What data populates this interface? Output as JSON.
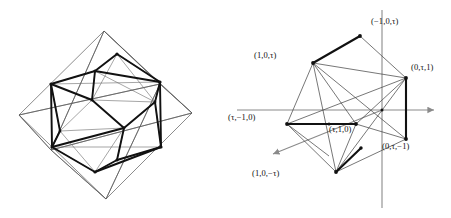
{
  "figure": {
    "type": "geometric-diagram",
    "panels": [
      "octahedron-icosahedron-wireframe",
      "coordinate-vertex-diagram"
    ]
  },
  "colors": {
    "ink": "#111111",
    "thin_line": "#5a5a5a",
    "axis": "#8a8a8a",
    "background": "#ffffff"
  },
  "left_panel": {
    "name": "octahedron-icosahedron-wireframe",
    "octahedron_vertices": [
      {
        "id": "top",
        "x": 104,
        "y": 31
      },
      {
        "id": "bottom",
        "x": 106,
        "y": 199
      },
      {
        "id": "left",
        "x": 19,
        "y": 115
      },
      {
        "id": "right",
        "x": 192,
        "y": 113
      },
      {
        "id": "front",
        "x": 51,
        "y": 150
      },
      {
        "id": "back",
        "x": 160,
        "y": 84
      }
    ],
    "icosahedron_vertices": [
      {
        "id": "v1",
        "x": 95,
        "y": 71
      },
      {
        "id": "v2",
        "x": 117,
        "y": 54
      },
      {
        "id": "v3",
        "x": 51,
        "y": 84
      },
      {
        "id": "v4",
        "x": 52,
        "y": 147
      },
      {
        "id": "v5",
        "x": 160,
        "y": 82
      },
      {
        "id": "v6",
        "x": 161,
        "y": 147
      },
      {
        "id": "v7",
        "x": 92,
        "y": 100
      },
      {
        "id": "v8",
        "x": 124,
        "y": 128
      },
      {
        "id": "v9",
        "x": 155,
        "y": 102
      },
      {
        "id": "v10",
        "x": 95,
        "y": 172
      },
      {
        "id": "v11",
        "x": 117,
        "y": 160
      },
      {
        "id": "v12",
        "x": 60,
        "y": 131
      }
    ]
  },
  "right_panel": {
    "name": "coordinate-vertex-diagram",
    "axes": {
      "vertical": {
        "x": 157,
        "y1": 10,
        "y2": 208
      },
      "horizontal": {
        "y": 110,
        "x1": 12,
        "x2": 212,
        "arrow": "right"
      },
      "diagonal": {
        "x1": 157,
        "y1": 110,
        "x2": 45,
        "y2": 156,
        "arrow": "down-left"
      }
    },
    "origin": {
      "x": 157,
      "y": 110
    },
    "vertices": [
      {
        "id": "p1",
        "label": "(−1,0,τ)",
        "x": 135,
        "y": 36,
        "label_x": 146,
        "label_y": 22,
        "label_align": "left"
      },
      {
        "id": "p2",
        "label": "(1,0,τ)",
        "x": 88,
        "y": 63,
        "label_x": 29,
        "label_y": 55,
        "label_align": "left"
      },
      {
        "id": "p3",
        "label": "(0,τ,1)",
        "x": 181,
        "y": 78,
        "label_x": 186,
        "label_y": 66,
        "label_align": "left"
      },
      {
        "id": "p4",
        "label": "(τ,−1,0)",
        "x": 62,
        "y": 124,
        "label_x": 5,
        "label_y": 117,
        "label_align": "left"
      },
      {
        "id": "p5",
        "label": "(τ,1,0)",
        "x": 131,
        "y": 124,
        "label_x": 104,
        "label_y": 128,
        "label_align": "left"
      },
      {
        "id": "p6",
        "label": "(0,τ,−1)",
        "x": 181,
        "y": 139,
        "label_x": 160,
        "label_y": 145,
        "label_align": "left"
      },
      {
        "id": "p7",
        "label": "(1,0,−τ)",
        "x": 111,
        "y": 172,
        "label_x": 27,
        "label_y": 173,
        "label_align": "left"
      },
      {
        "id": "p8",
        "label": "",
        "x": 104,
        "y": 156,
        "label_x": 0,
        "label_y": 0,
        "label_align": "none"
      }
    ],
    "bold_edges": [
      {
        "from": "p1",
        "to": "p2",
        "note": "golden rectangle short edge top"
      },
      {
        "from": "p3",
        "to": "p6",
        "note": "golden rectangle short edge right"
      },
      {
        "from": "p4",
        "to": "p5",
        "note": "golden rectangle short edge left"
      },
      {
        "from": "p7",
        "to": "p8",
        "note": "golden rectangle short edge bottom"
      }
    ],
    "thin_edges": [
      {
        "from": "p2",
        "to": "p3"
      },
      {
        "from": "p2",
        "to": "p4"
      },
      {
        "from": "p2",
        "to": "p5"
      },
      {
        "from": "p2",
        "to": "p6"
      },
      {
        "from": "p2",
        "to": "p7"
      },
      {
        "from": "p3",
        "to": "p4"
      },
      {
        "from": "p3",
        "to": "p5"
      },
      {
        "from": "p3",
        "to": "p7"
      },
      {
        "from": "p4",
        "to": "p7"
      },
      {
        "from": "p5",
        "to": "p6"
      },
      {
        "from": "p5",
        "to": "p7"
      },
      {
        "from": "p6",
        "to": "p7"
      },
      {
        "from": "p1",
        "to": "p3"
      }
    ]
  }
}
